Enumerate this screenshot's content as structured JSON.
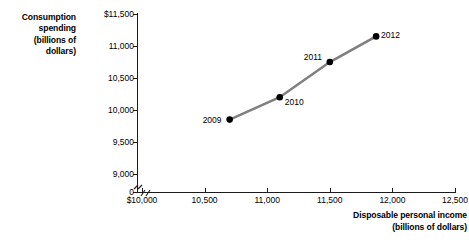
{
  "chart_data": {
    "type": "line",
    "title": "",
    "xlabel": "Disposable personal income (billions of dollars)",
    "ylabel": "Consumption spending (billions of dollars)",
    "xlim": [
      10000,
      12500
    ],
    "ylim": [
      9000,
      11500
    ],
    "grid": false,
    "legend": "none",
    "axis_break": {
      "x": true,
      "y": true,
      "y_zero_label": "0"
    },
    "series": [
      {
        "name": "Consumption function",
        "color": "#808080",
        "marker_color": "#000000",
        "points": [
          {
            "label": "2009",
            "x": 10700,
            "y": 9850,
            "label_pos": "left"
          },
          {
            "label": "2010",
            "x": 11100,
            "y": 10200,
            "label_pos": "right-below"
          },
          {
            "label": "2011",
            "x": 11500,
            "y": 10750,
            "label_pos": "left-above"
          },
          {
            "label": "2012",
            "x": 11870,
            "y": 11150,
            "label_pos": "right"
          }
        ]
      }
    ],
    "x_ticks": [
      {
        "value": 10000,
        "label": "$10,000"
      },
      {
        "value": 10500,
        "label": "10,500"
      },
      {
        "value": 11000,
        "label": "11,000"
      },
      {
        "value": 11500,
        "label": "11,500"
      },
      {
        "value": 12000,
        "label": "12,000"
      },
      {
        "value": 12500,
        "label": "12,500"
      }
    ],
    "y_ticks": [
      {
        "value": 11500,
        "label": "$11,500"
      },
      {
        "value": 11000,
        "label": "11,000"
      },
      {
        "value": 10500,
        "label": "10,500"
      },
      {
        "value": 10000,
        "label": "10,000"
      },
      {
        "value": 9500,
        "label": "9,500"
      },
      {
        "value": 9000,
        "label": "9,000"
      },
      {
        "value": 0,
        "label": "0"
      }
    ]
  },
  "y_axis_title_lines": [
    "Consumption",
    "spending",
    "(billions of",
    "dollars)"
  ],
  "x_axis_title_lines": [
    "Disposable personal income",
    "(billions of dollars)"
  ],
  "colors": {
    "line": "#808080",
    "marker": "#000000",
    "axis": "#1b1b1b",
    "text": "#000000",
    "background": "#ffffff"
  }
}
